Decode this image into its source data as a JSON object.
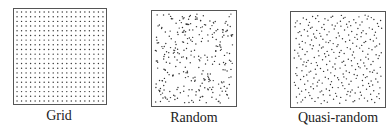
{
  "panels": [
    {
      "id": "grid",
      "label": "Grid",
      "box": {
        "x": 13,
        "y": 8,
        "w": 94,
        "h": 97
      },
      "pattern": "grid",
      "cols": 20,
      "rows": 20,
      "label_x": 59,
      "label_y": 108
    },
    {
      "id": "random",
      "label": "Random",
      "box": {
        "x": 151,
        "y": 10,
        "w": 86,
        "h": 97
      },
      "pattern": "random",
      "count": 300,
      "seed": 7,
      "label_x": 194,
      "label_y": 110
    },
    {
      "id": "quasi",
      "label": "Quasi-random",
      "box": {
        "x": 290,
        "y": 11,
        "w": 96,
        "h": 97
      },
      "pattern": "quasi",
      "count": 300,
      "label_x": 338,
      "label_y": 110
    }
  ],
  "dot_color": "#333333",
  "dot_radius": 0.7
}
